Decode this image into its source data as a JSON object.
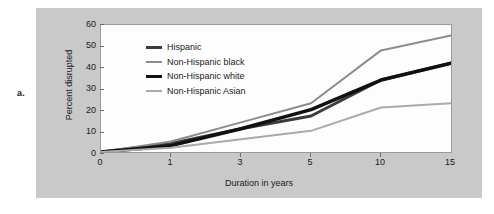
{
  "panel_label": "a.",
  "colors": {
    "page_background": "#ffffff",
    "figure_background": "#c9c9c9",
    "plot_background": "#fdfdfd",
    "plot_border": "#9a9a9a",
    "axis_text": "#1a1a1a",
    "hispanic": "#3b3b3b",
    "non_hispanic_black": "#8c8c8c",
    "non_hispanic_white": "#111111",
    "non_hispanic_asian": "#aaaaaa"
  },
  "legend": {
    "items": [
      {
        "label": "Hispanic",
        "color": "#3b3b3b",
        "thickness": 3
      },
      {
        "label": "Non-Hispanic black",
        "color": "#8c8c8c",
        "thickness": 2
      },
      {
        "label": "Non-Hispanic white",
        "color": "#111111",
        "thickness": 3.5
      },
      {
        "label": "Non-Hispanic Asian",
        "color": "#aaaaaa",
        "thickness": 2
      }
    ]
  },
  "chart_data": {
    "type": "line",
    "title": "",
    "xlabel": "Duration in years",
    "ylabel": "Percent disrupted",
    "categories": [
      "0",
      "1",
      "3",
      "5",
      "10",
      "15"
    ],
    "xticks": [
      "0",
      "1",
      "3",
      "5",
      "10",
      "15"
    ],
    "yticks": [
      0,
      10,
      20,
      30,
      40,
      50,
      60
    ],
    "ylim": [
      0,
      60
    ],
    "grid": false,
    "legend_position": "upper-left-inside",
    "series": [
      {
        "name": "Hispanic",
        "color": "#3b3b3b",
        "thickness": 3,
        "values": [
          0,
          4,
          11,
          17,
          34,
          42
        ]
      },
      {
        "name": "Non-Hispanic black",
        "color": "#8c8c8c",
        "thickness": 2,
        "values": [
          0,
          5,
          14,
          23,
          48,
          55
        ]
      },
      {
        "name": "Non-Hispanic white",
        "color": "#111111",
        "thickness": 3.5,
        "values": [
          0,
          3,
          11,
          20,
          34,
          42
        ]
      },
      {
        "name": "Non-Hispanic Asian",
        "color": "#aaaaaa",
        "thickness": 2,
        "values": [
          0,
          2,
          6,
          10,
          21,
          23
        ]
      }
    ]
  }
}
